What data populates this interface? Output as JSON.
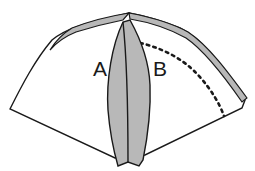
{
  "diagram": {
    "labels": {
      "a": "A",
      "b": "B"
    },
    "colors": {
      "line": "#1a1a1a",
      "paper": "#ffffff",
      "shaded": "#b8b8b8",
      "background": "#ffffff"
    },
    "elements": [
      "fan-shaped paper outline",
      "folded-over top band (shaded)",
      "dotted fold line",
      "shaded center petal flap",
      "center crease"
    ]
  }
}
